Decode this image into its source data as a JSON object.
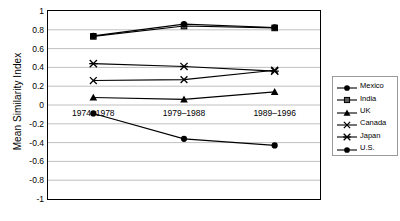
{
  "chart_data": {
    "type": "line",
    "title": "",
    "xlabel": "",
    "ylabel": "Mean Similarity Index",
    "categories": [
      "1974–1978",
      "1979–1988",
      "1989–1996"
    ],
    "ylim": [
      -1,
      1
    ],
    "yticks": [
      1,
      0.8,
      0.6,
      0.4,
      0.2,
      0,
      -0.2,
      -0.4,
      -0.6,
      -0.8,
      -1
    ],
    "ytick_labels": [
      "1",
      "0.8",
      "0.6",
      "0.4",
      "0.2",
      "0",
      "-0.2",
      "-0.4",
      "-0.6",
      "-0.8",
      "-1"
    ],
    "grid": true,
    "legend_position": "right",
    "series": [
      {
        "name": "Mexico",
        "marker": "circle-filled",
        "color": "#000000",
        "values": [
          -0.09,
          -0.36,
          -0.43
        ]
      },
      {
        "name": "India",
        "marker": "square-filled",
        "color": "#000000",
        "values": [
          0.73,
          0.84,
          0.82
        ]
      },
      {
        "name": "UK",
        "marker": "triangle-filled",
        "color": "#000000",
        "values": [
          0.08,
          0.06,
          0.14
        ]
      },
      {
        "name": "Canada",
        "marker": "cross-x",
        "color": "#000000",
        "values": [
          0.26,
          0.27,
          0.37
        ]
      },
      {
        "name": "Japan",
        "marker": "asterisk",
        "color": "#000000",
        "values": [
          0.44,
          0.41,
          0.36
        ]
      },
      {
        "name": "U.S.",
        "marker": "circle-filled",
        "color": "#000000",
        "values": [
          0.735,
          0.86,
          0.825
        ]
      }
    ]
  },
  "axis": {
    "y_title": "Mean Similarity Index"
  },
  "legend": {
    "entries": [
      {
        "label": "Mexico"
      },
      {
        "label": "India"
      },
      {
        "label": "UK"
      },
      {
        "label": "Canada"
      },
      {
        "label": "Japan"
      },
      {
        "label": "U.S."
      }
    ]
  }
}
